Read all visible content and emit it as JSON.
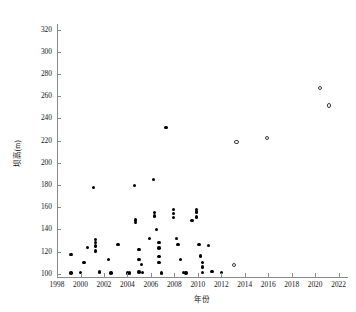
{
  "chart_data": {
    "type": "scatter",
    "title": "",
    "xlabel": "年份",
    "ylabel": "坝高(m)",
    "xlim": [
      1998,
      2022.8
    ],
    "ylim": [
      97,
      325
    ],
    "xticks": [
      1998,
      2000,
      2002,
      2004,
      2006,
      2008,
      2010,
      2012,
      2014,
      2016,
      2018,
      2020,
      2022
    ],
    "xticklabels": [
      "1998",
      "2000",
      "2002",
      "2004",
      "2006",
      "2008",
      "2010",
      "2012",
      "2014",
      "2016",
      "2018",
      "2020",
      "2022"
    ],
    "yticks": [
      100,
      120,
      140,
      160,
      180,
      200,
      220,
      240,
      260,
      280,
      300,
      320
    ],
    "yticklabels": [
      "100",
      "120",
      "140",
      "160",
      "180",
      "200",
      "220",
      "240",
      "260",
      "280",
      "300",
      "320"
    ],
    "grid": false,
    "legend": null,
    "series": [
      {
        "name": "已建坝",
        "marker": "filled-circle",
        "color": "#000000",
        "points": [
          [
            1999.2,
            117.5
          ],
          [
            1999.2,
            100.5
          ],
          [
            2000.0,
            101.0
          ],
          [
            2000.3,
            110.0
          ],
          [
            2000.6,
            123.5
          ],
          [
            2001.1,
            177.5
          ],
          [
            2001.3,
            131.0
          ],
          [
            2001.3,
            128.0
          ],
          [
            2001.3,
            125.0
          ],
          [
            2001.3,
            120.5
          ],
          [
            2001.6,
            101.5
          ],
          [
            2002.4,
            113.0
          ],
          [
            2002.6,
            100.5
          ],
          [
            2003.2,
            126.0
          ],
          [
            2004.0,
            100.5
          ],
          [
            2004.2,
            100.5
          ],
          [
            2004.6,
            179.5
          ],
          [
            2004.7,
            148.5
          ],
          [
            2004.7,
            146.0
          ],
          [
            2005.0,
            121.5
          ],
          [
            2005.0,
            113.0
          ],
          [
            2005.0,
            101.5
          ],
          [
            2005.2,
            108.5
          ],
          [
            2005.3,
            101.0
          ],
          [
            2005.9,
            132.0
          ],
          [
            2006.2,
            185.0
          ],
          [
            2006.3,
            155.0
          ],
          [
            2006.3,
            152.0
          ],
          [
            2006.5,
            140.0
          ],
          [
            2006.7,
            128.0
          ],
          [
            2006.7,
            123.0
          ],
          [
            2006.7,
            115.5
          ],
          [
            2006.7,
            110.0
          ],
          [
            2006.9,
            100.5
          ],
          [
            2007.3,
            231.5
          ],
          [
            2007.9,
            158.0
          ],
          [
            2007.9,
            154.0
          ],
          [
            2007.9,
            150.5
          ],
          [
            2008.2,
            132.0
          ],
          [
            2008.3,
            126.5
          ],
          [
            2008.5,
            112.5
          ],
          [
            2008.8,
            101.0
          ],
          [
            2009.0,
            100.5
          ],
          [
            2009.5,
            148.0
          ],
          [
            2009.9,
            158.0
          ],
          [
            2009.9,
            155.5
          ],
          [
            2009.9,
            151.0
          ],
          [
            2010.1,
            126.0
          ],
          [
            2010.2,
            116.0
          ],
          [
            2010.4,
            110.0
          ],
          [
            2010.4,
            106.0
          ],
          [
            2010.4,
            101.0
          ],
          [
            2010.9,
            125.5
          ],
          [
            2011.2,
            102.0
          ],
          [
            2012.0,
            101.0
          ]
        ]
      },
      {
        "name": "在建坝",
        "marker": "open-circle",
        "color": "#3a3a3a",
        "points": [
          [
            2013.1,
            108.0
          ],
          [
            2013.3,
            218.5
          ],
          [
            2015.9,
            222.0
          ],
          [
            2020.4,
            267.5
          ],
          [
            2021.2,
            251.5
          ]
        ]
      }
    ]
  }
}
